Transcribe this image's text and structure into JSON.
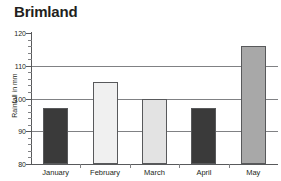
{
  "chart_data": {
    "type": "bar",
    "title": "Brimland",
    "xlabel": "",
    "ylabel": "Rainfall in mm",
    "categories": [
      "January",
      "February",
      "March",
      "April",
      "May"
    ],
    "values": [
      97,
      105,
      100,
      97,
      116
    ],
    "ylim": [
      80,
      120
    ],
    "ytick_labels": [
      "80",
      "90",
      "100",
      "110",
      "120"
    ],
    "ytick_values": [
      80,
      90,
      100,
      110,
      120
    ],
    "minor_tick_step": 2,
    "gridlines": [
      90,
      100,
      110
    ],
    "grid": true,
    "legend": "none",
    "bar_colors": [
      "#3a3a3a",
      "#f0f0f0",
      "#e3e3e3",
      "#3a3a3a",
      "#a8a8a8"
    ],
    "bar_border_color": "#58595b",
    "axis_color": "#58595b",
    "grid_color": "#808184",
    "text_color": "#231f20",
    "background": "#ffffff",
    "series": [
      {
        "name": "Rainfall",
        "points": [
          {
            "category": "January",
            "value": 97,
            "color": "#3a3a3a"
          },
          {
            "category": "February",
            "value": 105,
            "color": "#f0f0f0"
          },
          {
            "category": "March",
            "value": 100,
            "color": "#e3e3e3"
          },
          {
            "category": "April",
            "value": 97,
            "color": "#3a3a3a"
          },
          {
            "category": "May",
            "value": 116,
            "color": "#a8a8a8"
          }
        ]
      }
    ]
  }
}
